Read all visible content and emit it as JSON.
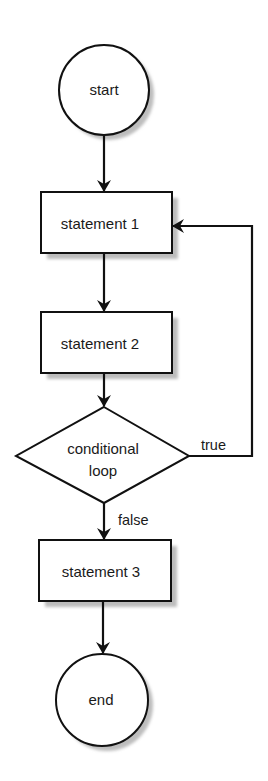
{
  "diagram": {
    "type": "flowchart",
    "colors": {
      "stroke": "#111111",
      "fill": "#ffffff",
      "shadow": "#bdbdbd",
      "text": "#1a1a1a"
    },
    "nodes": {
      "start": {
        "shape": "circle",
        "label": "start"
      },
      "statement1": {
        "shape": "rectangle",
        "label": "statement 1"
      },
      "statement2": {
        "shape": "rectangle",
        "label": "statement 2"
      },
      "condition": {
        "shape": "diamond",
        "label_line1": "conditional",
        "label_line2": "loop"
      },
      "statement3": {
        "shape": "rectangle",
        "label": "statement 3"
      },
      "end": {
        "shape": "circle",
        "label": "end"
      }
    },
    "edges": [
      {
        "from": "start",
        "to": "statement1",
        "label": ""
      },
      {
        "from": "statement1",
        "to": "statement2",
        "label": ""
      },
      {
        "from": "statement2",
        "to": "condition",
        "label": ""
      },
      {
        "from": "condition",
        "to": "statement1",
        "label": "true"
      },
      {
        "from": "condition",
        "to": "statement3",
        "label": "false"
      },
      {
        "from": "statement3",
        "to": "end",
        "label": ""
      }
    ],
    "edge_labels": {
      "true": "true",
      "false": "false"
    }
  }
}
